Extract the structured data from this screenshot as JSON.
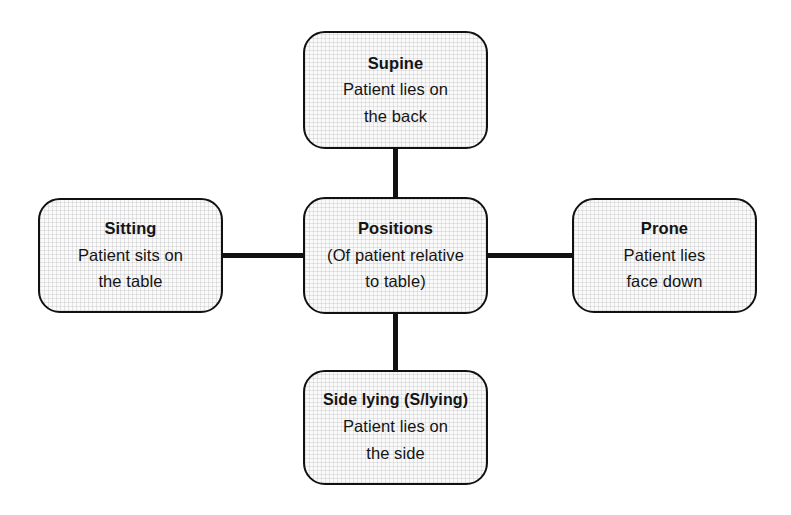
{
  "diagram": {
    "type": "mind-map",
    "center": {
      "id": "positions",
      "title": "Positions",
      "lines": [
        "(Of patient relative",
        "to table)"
      ]
    },
    "branches": [
      {
        "id": "supine",
        "title": "Supine",
        "lines": [
          "Patient lies on",
          "the back"
        ],
        "direction": "top"
      },
      {
        "id": "sitting",
        "title": "Sitting",
        "lines": [
          "Patient sits on",
          "the table"
        ],
        "direction": "left"
      },
      {
        "id": "prone",
        "title": "Prone",
        "lines": [
          "Patient lies",
          "face down"
        ],
        "direction": "right"
      },
      {
        "id": "side-lying",
        "title": "Side lying (S/lying)",
        "lines": [
          "Patient lies on",
          "the side"
        ],
        "direction": "bottom"
      }
    ],
    "style": {
      "background": "#ffffff",
      "node_fill": "#fafafa",
      "node_border": "#111111",
      "connector": "#111111",
      "text": "#141414"
    }
  }
}
